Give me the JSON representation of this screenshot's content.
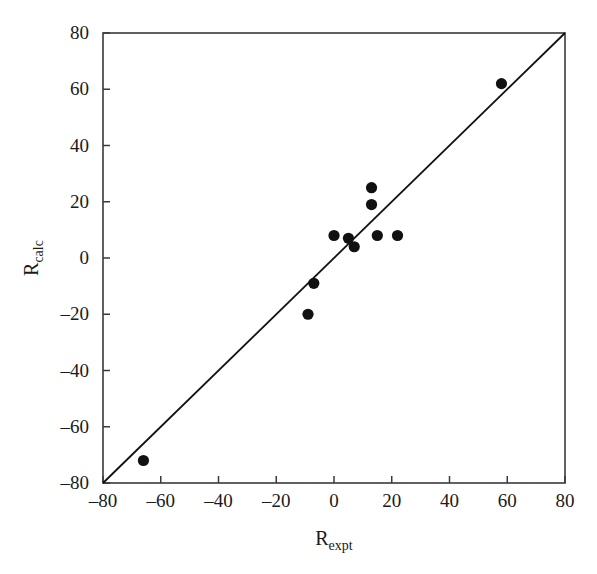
{
  "chart_data": {
    "type": "scatter",
    "title": "",
    "xlabel": "R_expt",
    "xlabel_base": "R",
    "xlabel_sub": "expt",
    "ylabel": "R_calc",
    "ylabel_base": "R",
    "ylabel_sub": "calc",
    "xlim": [
      -80,
      80
    ],
    "ylim": [
      -80,
      80
    ],
    "xticks": [
      -80,
      -60,
      -40,
      -20,
      0,
      20,
      40,
      60,
      80
    ],
    "yticks": [
      -80,
      -60,
      -40,
      -20,
      0,
      20,
      40,
      60,
      80
    ],
    "xtick_labels": [
      "–80",
      "–60",
      "–40",
      "–20",
      "0",
      "20",
      "40",
      "60",
      "80"
    ],
    "ytick_labels": [
      "–80",
      "–60",
      "–40",
      "–20",
      "0",
      "20",
      "40",
      "60",
      "80"
    ],
    "grid": false,
    "legend": null,
    "marker_color": "#111111",
    "line_color": "#111111",
    "axis_color": "#3a3a3a",
    "background": "#ffffff",
    "reference_line": {
      "kind": "identity",
      "equation": "y = x",
      "from": [
        -80,
        -80
      ],
      "to": [
        80,
        80
      ]
    },
    "points": [
      {
        "x": -66,
        "y": -72
      },
      {
        "x": -9,
        "y": -20
      },
      {
        "x": -7,
        "y": -9
      },
      {
        "x": 0,
        "y": 8
      },
      {
        "x": 5,
        "y": 7
      },
      {
        "x": 7,
        "y": 4
      },
      {
        "x": 13,
        "y": 25
      },
      {
        "x": 13,
        "y": 19
      },
      {
        "x": 15,
        "y": 8
      },
      {
        "x": 22,
        "y": 8
      },
      {
        "x": 58,
        "y": 62
      }
    ]
  },
  "figure": {
    "caption": ""
  }
}
